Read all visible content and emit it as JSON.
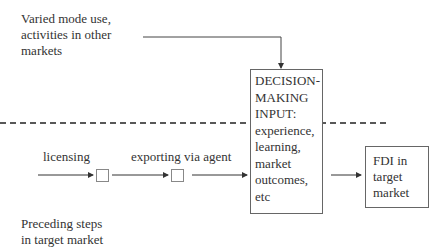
{
  "labels": {
    "other_markets": "Varied mode use,\nactivities in other\nmarkets",
    "decision_box": "DECISION-\nMAKING\nINPUT:\nexperience,\nlearning,\nmarket\noutcomes,\netc",
    "fdi_box": "FDI in\ntarget\nmarket",
    "licensing": "licensing",
    "exporting": "exporting via agent",
    "preceding_steps": "Preceding steps\nin target market"
  }
}
